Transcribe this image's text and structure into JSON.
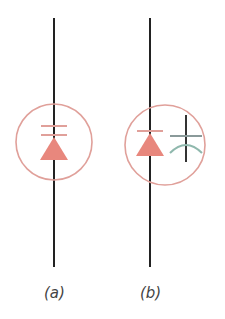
{
  "figure": {
    "panels": [
      {
        "id": "a",
        "label": "(a)",
        "description": "Diode symbol with bar inside circle"
      },
      {
        "id": "b",
        "label": "(b)",
        "description": "Diode symbol with curved-plate capacitor inside circle"
      }
    ],
    "colors": {
      "wire": "#222222",
      "circle": "#e0a09a",
      "diode": "#e8877d",
      "capacitor_plate": "#8a9a9a",
      "capacitor_curve": "#8fb8ad"
    }
  }
}
